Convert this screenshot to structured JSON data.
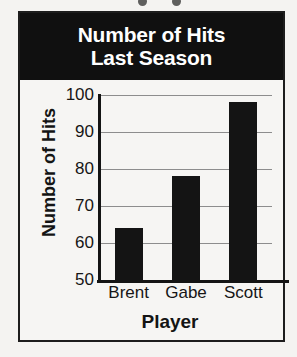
{
  "chart_data": {
    "type": "bar",
    "title": "Number of Hits Last Season",
    "title_lines": [
      "Number of Hits",
      "Last Season"
    ],
    "categories": [
      "Brent",
      "Gabe",
      "Scott"
    ],
    "values": [
      64,
      78,
      98
    ],
    "xlabel": "Player",
    "ylabel": "Number of Hits",
    "ylim": [
      50,
      100
    ],
    "yticks": [
      50,
      60,
      70,
      80,
      90,
      100
    ],
    "ytick_labels": [
      "50",
      "60",
      "70",
      "80",
      "90",
      "100"
    ],
    "grid": true,
    "legend": false,
    "colors": {
      "bar": "#141414",
      "title_background": "#101010",
      "title_text": "#ffffff",
      "gridline": "#8d8d8d",
      "axis": "#141414",
      "plot_background": "#f6f5f3",
      "frame": "#1d1d1d"
    }
  }
}
